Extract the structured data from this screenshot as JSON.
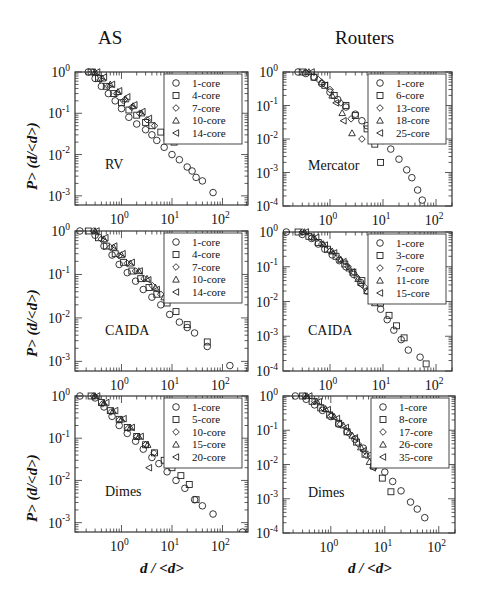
{
  "figure": {
    "column_titles": [
      "AS",
      "Routers"
    ],
    "y_axis_label": "P> (d/<d>)",
    "x_axis_label": "d / <d>"
  },
  "colors": {
    "frame": "#333333",
    "marker": "#222222",
    "background": "#ffffff"
  },
  "chart_data": [
    {
      "type": "scatter",
      "panel": "AS-RV",
      "title": "AS",
      "annotation": "RV",
      "xscale": "log",
      "yscale": "log",
      "xlabel": "",
      "ylabel": "P> (d/<d>)",
      "xlim": [
        0.12,
        320
      ],
      "ylim": [
        0.0006,
        1
      ],
      "xticks": [
        "10^0",
        "10^1",
        "10^2"
      ],
      "yticks": [
        "10^0",
        "10^-1",
        "10^-2",
        "10^-3"
      ],
      "legend_position": "upper right",
      "series": [
        {
          "name": "1-core",
          "marker": "circle",
          "x": [
            0.22,
            0.3,
            0.4,
            0.55,
            0.75,
            1,
            1.4,
            2,
            3,
            4,
            5,
            7,
            10,
            14,
            20,
            25,
            30,
            40,
            65
          ],
          "y": [
            1,
            0.7,
            0.45,
            0.3,
            0.2,
            0.13,
            0.08,
            0.055,
            0.04,
            0.03,
            0.022,
            0.015,
            0.01,
            0.0075,
            0.005,
            0.004,
            0.0028,
            0.0023,
            0.0012
          ]
        },
        {
          "name": "4-core",
          "marker": "square",
          "x": [
            0.25,
            0.35,
            0.5,
            0.7,
            1,
            1.4,
            2,
            3,
            4,
            6,
            8,
            11
          ],
          "y": [
            1,
            0.7,
            0.45,
            0.3,
            0.18,
            0.12,
            0.09,
            0.06,
            0.05,
            0.035,
            0.025,
            0.02
          ]
        },
        {
          "name": "7-core",
          "marker": "diamond",
          "x": [
            0.27,
            0.38,
            0.55,
            0.8,
            1.1,
            1.6,
            2.3,
            3.2,
            4.5
          ],
          "y": [
            1,
            0.65,
            0.45,
            0.3,
            0.2,
            0.14,
            0.1,
            0.07,
            0.05
          ]
        },
        {
          "name": "10-core",
          "marker": "triangle-up",
          "x": [
            0.3,
            0.42,
            0.6,
            0.85,
            1.2,
            1.7,
            2.5
          ],
          "y": [
            1,
            0.7,
            0.5,
            0.33,
            0.22,
            0.15,
            0.1
          ]
        },
        {
          "name": "14-core",
          "marker": "triangle-left",
          "x": [
            0.33,
            0.45,
            0.65,
            0.9,
            1.3,
            1.8,
            2.6,
            3.5
          ],
          "y": [
            1,
            0.75,
            0.5,
            0.35,
            0.25,
            0.16,
            0.11,
            0.075
          ]
        }
      ]
    },
    {
      "type": "scatter",
      "panel": "Routers-Mercator",
      "title": "Routers",
      "annotation": "Mercator",
      "xscale": "log",
      "yscale": "log",
      "xlabel": "",
      "ylabel": "",
      "xlim": [
        0.13,
        200
      ],
      "ylim": [
        0.0001,
        1
      ],
      "xticks": [
        "10^0",
        "10^1",
        "10^2"
      ],
      "yticks": [
        "10^0",
        "10^-1",
        "10^-2",
        "10^-3",
        "10^-4"
      ],
      "legend_position": "upper right",
      "series": [
        {
          "name": "1-core",
          "marker": "circle",
          "x": [
            0.25,
            0.35,
            0.5,
            0.7,
            1,
            1.4,
            2,
            3,
            4,
            5,
            7,
            10,
            14,
            20,
            28,
            35,
            45,
            55
          ],
          "y": [
            1,
            0.9,
            0.7,
            0.45,
            0.25,
            0.15,
            0.09,
            0.055,
            0.035,
            0.025,
            0.015,
            0.009,
            0.005,
            0.0025,
            0.0012,
            0.0007,
            0.0003,
            0.00015
          ]
        },
        {
          "name": "6-core",
          "marker": "square",
          "x": [
            0.3,
            0.5,
            0.8,
            1.2,
            2,
            3,
            5,
            7,
            9
          ],
          "y": [
            1,
            0.7,
            0.4,
            0.2,
            0.1,
            0.05,
            0.02,
            0.007,
            0.002
          ]
        },
        {
          "name": "13-core",
          "marker": "diamond",
          "x": [
            0.35,
            0.6,
            1,
            1.6,
            2.5,
            4
          ],
          "y": [
            1,
            0.6,
            0.3,
            0.12,
            0.04,
            0.01
          ]
        },
        {
          "name": "18-core",
          "marker": "triangle-up",
          "x": [
            0.4,
            0.7,
            1.1,
            1.7,
            2.6
          ],
          "y": [
            1,
            0.5,
            0.2,
            0.06,
            0.015
          ]
        },
        {
          "name": "25-core",
          "marker": "triangle-left",
          "x": [
            0.45,
            0.8,
            1.3,
            1.8
          ],
          "y": [
            1,
            0.4,
            0.12,
            0.035
          ]
        }
      ]
    },
    {
      "type": "scatter",
      "panel": "AS-CAIDA",
      "title": "",
      "annotation": "CAIDA",
      "xscale": "log",
      "yscale": "log",
      "xlabel": "",
      "ylabel": "P> (d/<d>)",
      "xlim": [
        0.12,
        320
      ],
      "ylim": [
        0.0006,
        1
      ],
      "xticks": [
        "10^0",
        "10^1",
        "10^2"
      ],
      "yticks": [
        "10^0",
        "10^-1",
        "10^-2",
        "10^-3"
      ],
      "legend_position": "upper right",
      "series": [
        {
          "name": "1-core",
          "marker": "circle",
          "x": [
            0.15,
            0.3,
            0.45,
            0.65,
            0.9,
            1.3,
            1.9,
            2.7,
            4,
            6,
            9,
            14,
            20,
            28,
            50,
            140
          ],
          "y": [
            1,
            0.8,
            0.45,
            0.28,
            0.17,
            0.11,
            0.07,
            0.045,
            0.03,
            0.02,
            0.012,
            0.008,
            0.006,
            0.0045,
            0.0022,
            0.0008
          ]
        },
        {
          "name": "4-core",
          "marker": "square",
          "x": [
            0.22,
            0.35,
            0.5,
            0.75,
            1.1,
            1.6,
            2.4,
            3.5,
            5,
            8,
            12,
            20,
            50
          ],
          "y": [
            1,
            0.7,
            0.45,
            0.3,
            0.19,
            0.12,
            0.08,
            0.05,
            0.035,
            0.022,
            0.014,
            0.007,
            0.0028
          ]
        },
        {
          "name": "7-core",
          "marker": "diamond",
          "x": [
            0.28,
            0.4,
            0.6,
            0.9,
            1.3,
            1.9,
            2.8,
            4.1,
            6
          ],
          "y": [
            1,
            0.65,
            0.42,
            0.27,
            0.18,
            0.12,
            0.08,
            0.055,
            0.035
          ]
        },
        {
          "name": "10-core",
          "marker": "triangle-up",
          "x": [
            0.3,
            0.45,
            0.7,
            1,
            1.5,
            2.2,
            3.2,
            4.7,
            7
          ],
          "y": [
            1,
            0.65,
            0.42,
            0.28,
            0.18,
            0.12,
            0.08,
            0.05,
            0.03
          ]
        },
        {
          "name": "14-core",
          "marker": "triangle-left",
          "x": [
            0.32,
            0.48,
            0.72,
            1.05,
            1.6,
            2.3,
            3.4,
            5
          ],
          "y": [
            1,
            0.7,
            0.45,
            0.3,
            0.19,
            0.12,
            0.075,
            0.045
          ]
        }
      ]
    },
    {
      "type": "scatter",
      "panel": "Routers-CAIDA",
      "title": "",
      "annotation": "CAIDA",
      "xscale": "log",
      "yscale": "log",
      "xlabel": "",
      "ylabel": "",
      "xlim": [
        0.13,
        200
      ],
      "ylim": [
        0.0001,
        1
      ],
      "xticks": [
        "10^0",
        "10^1",
        "10^2"
      ],
      "yticks": [
        "10^0",
        "10^-1",
        "10^-2",
        "10^-3",
        "10^-4"
      ],
      "legend_position": "upper right",
      "series": [
        {
          "name": "1-core",
          "marker": "circle",
          "x": [
            0.15,
            0.3,
            0.45,
            0.6,
            0.8,
            1.1,
            1.5,
            2,
            2.8,
            3.8,
            5,
            7,
            9,
            12,
            16,
            22,
            30,
            50
          ],
          "y": [
            1,
            0.85,
            0.65,
            0.45,
            0.32,
            0.22,
            0.15,
            0.1,
            0.06,
            0.035,
            0.02,
            0.011,
            0.006,
            0.003,
            0.0015,
            0.0008,
            0.0004,
            0.00025
          ]
        },
        {
          "name": "3-core",
          "marker": "square",
          "x": [
            0.25,
            0.4,
            0.6,
            0.9,
            1.3,
            1.9,
            2.7,
            4,
            6,
            9,
            13,
            18,
            25,
            65
          ],
          "y": [
            1,
            0.75,
            0.5,
            0.32,
            0.2,
            0.12,
            0.07,
            0.04,
            0.02,
            0.009,
            0.004,
            0.002,
            0.0009,
            0.00016
          ]
        },
        {
          "name": "7-core",
          "marker": "diamond",
          "x": [
            0.3,
            0.45,
            0.7,
            1,
            1.5,
            2.2,
            3.2,
            4.6,
            6.5
          ],
          "y": [
            1,
            0.7,
            0.45,
            0.28,
            0.17,
            0.1,
            0.05,
            0.025,
            0.012
          ]
        },
        {
          "name": "11-core",
          "marker": "triangle-up",
          "x": [
            0.33,
            0.5,
            0.75,
            1.1,
            1.6,
            2.3,
            3.4,
            5,
            7
          ],
          "y": [
            1,
            0.7,
            0.45,
            0.28,
            0.16,
            0.09,
            0.045,
            0.02,
            0.009
          ]
        },
        {
          "name": "15-core",
          "marker": "triangle-left",
          "x": [
            0.35,
            0.55,
            0.8,
            1.2,
            1.8,
            2.6,
            3.8
          ],
          "y": [
            1,
            0.7,
            0.42,
            0.25,
            0.14,
            0.07,
            0.03
          ]
        }
      ]
    },
    {
      "type": "scatter",
      "panel": "AS-Dimes",
      "title": "",
      "annotation": "Dimes",
      "xscale": "log",
      "yscale": "log",
      "xlabel": "d / <d>",
      "ylabel": "P> (d/<d>)",
      "xlim": [
        0.12,
        320
      ],
      "ylim": [
        0.0006,
        1
      ],
      "xticks": [
        "10^0",
        "10^1",
        "10^2"
      ],
      "yticks": [
        "10^0",
        "10^-1",
        "10^-2",
        "10^-3"
      ],
      "legend_position": "upper right",
      "series": [
        {
          "name": "1-core",
          "marker": "circle",
          "x": [
            0.15,
            0.3,
            0.45,
            0.65,
            0.9,
            1.3,
            1.9,
            2.7,
            4,
            5.5,
            8,
            12,
            18,
            28,
            40,
            65,
            250
          ],
          "y": [
            1,
            0.9,
            0.55,
            0.33,
            0.2,
            0.13,
            0.085,
            0.055,
            0.035,
            0.025,
            0.016,
            0.01,
            0.0065,
            0.0035,
            0.0025,
            0.0016,
            0.0006
          ]
        },
        {
          "name": "5-core",
          "marker": "square",
          "x": [
            0.25,
            0.4,
            0.6,
            0.9,
            1.3,
            2,
            3,
            4.5,
            7,
            10,
            15,
            22,
            30
          ],
          "y": [
            1,
            0.7,
            0.45,
            0.28,
            0.18,
            0.11,
            0.07,
            0.045,
            0.03,
            0.02,
            0.013,
            0.008,
            0.0035
          ]
        },
        {
          "name": "10-core",
          "marker": "diamond",
          "x": [
            0.28,
            0.42,
            0.62,
            0.9,
            1.35,
            2,
            3,
            4.4
          ],
          "y": [
            1,
            0.65,
            0.42,
            0.27,
            0.17,
            0.11,
            0.07,
            0.045
          ]
        },
        {
          "name": "15-core",
          "marker": "triangle-up",
          "x": [
            0.3,
            0.45,
            0.68,
            1,
            1.5,
            2.2,
            3.3
          ],
          "y": [
            1,
            0.68,
            0.44,
            0.28,
            0.18,
            0.11,
            0.07
          ]
        },
        {
          "name": "20-core",
          "marker": "triangle-left",
          "x": [
            0.33,
            0.5,
            0.75,
            1.1,
            1.6,
            2.4,
            3.5
          ],
          "y": [
            1,
            0.7,
            0.45,
            0.29,
            0.18,
            0.11,
            0.02
          ]
        }
      ]
    },
    {
      "type": "scatter",
      "panel": "Routers-Dimes",
      "title": "",
      "annotation": "Dimes",
      "xscale": "log",
      "yscale": "log",
      "xlabel": "d / <d>",
      "ylabel": "",
      "xlim": [
        0.13,
        200
      ],
      "ylim": [
        0.0001,
        1
      ],
      "xticks": [
        "10^0",
        "10^1",
        "10^2"
      ],
      "yticks": [
        "10^0",
        "10^-1",
        "10^-2",
        "10^-3",
        "10^-4"
      ],
      "legend_position": "upper right",
      "series": [
        {
          "name": "1-core",
          "marker": "circle",
          "x": [
            0.22,
            0.35,
            0.5,
            0.7,
            1,
            1.4,
            2,
            2.8,
            4,
            5.5,
            7.5,
            10,
            14,
            20,
            30,
            40,
            55
          ],
          "y": [
            1,
            0.8,
            0.55,
            0.38,
            0.25,
            0.15,
            0.09,
            0.055,
            0.03,
            0.018,
            0.01,
            0.006,
            0.0032,
            0.0017,
            0.0008,
            0.0005,
            0.00028
          ]
        },
        {
          "name": "8-core",
          "marker": "square",
          "x": [
            0.3,
            0.45,
            0.65,
            0.95,
            1.4,
            2,
            3,
            4.3,
            6.2,
            9,
            13
          ],
          "y": [
            1,
            0.7,
            0.45,
            0.28,
            0.16,
            0.09,
            0.045,
            0.02,
            0.009,
            0.004,
            0.0016
          ]
        },
        {
          "name": "17-core",
          "marker": "diamond",
          "x": [
            0.33,
            0.5,
            0.72,
            1.05,
            1.5,
            2.2,
            3.2,
            4.6
          ],
          "y": [
            1,
            0.7,
            0.45,
            0.27,
            0.15,
            0.08,
            0.04,
            0.018
          ]
        },
        {
          "name": "26-core",
          "marker": "triangle-up",
          "x": [
            0.36,
            0.55,
            0.8,
            1.15,
            1.7,
            2.5,
            3.6,
            5.2
          ],
          "y": [
            1,
            0.7,
            0.42,
            0.25,
            0.14,
            0.07,
            0.032,
            0.012
          ]
        },
        {
          "name": "35-core",
          "marker": "triangle-left",
          "x": [
            0.4,
            0.6,
            0.88,
            1.3,
            1.9,
            2.8,
            4,
            6
          ],
          "y": [
            1,
            0.68,
            0.4,
            0.22,
            0.12,
            0.06,
            0.025,
            0.008
          ]
        }
      ]
    }
  ],
  "panel_frames": [
    {
      "left": 75,
      "top": 72,
      "right": 248,
      "bottom": 205
    },
    {
      "left": 283,
      "top": 72,
      "right": 452,
      "bottom": 206
    },
    {
      "left": 75,
      "top": 231,
      "right": 248,
      "bottom": 371
    },
    {
      "left": 283,
      "top": 232,
      "right": 452,
      "bottom": 371
    },
    {
      "left": 75,
      "top": 396,
      "right": 248,
      "bottom": 532
    },
    {
      "left": 283,
      "top": 396,
      "right": 455,
      "bottom": 533
    }
  ]
}
